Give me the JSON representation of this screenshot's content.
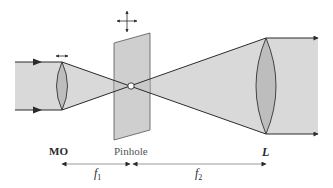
{
  "figure": {
    "colors": {
      "beam_fill": "#d9d9d9",
      "lens_fill": "#bdbdbd",
      "pinhole_plate_fill": "#d0d0d0",
      "line": "#2b2b2b",
      "dimension_line": "#888888"
    }
  },
  "labels": {
    "objective": "MO",
    "pinhole": "Pinhole",
    "lens": "L",
    "f1_symbol": "f",
    "f1_sub": "1",
    "f2_symbol": "f",
    "f2_sub": "2"
  },
  "components": [
    {
      "name": "microscope-objective",
      "label": "MO",
      "motion": "horizontal-translation-arrow"
    },
    {
      "name": "pinhole-plate",
      "label": "Pinhole",
      "motion": "xy-translation-arrows"
    },
    {
      "name": "collimating-lens",
      "label": "L"
    }
  ],
  "dimensions": [
    {
      "name": "f1",
      "from": "MO",
      "to": "Pinhole"
    },
    {
      "name": "f2",
      "from": "Pinhole",
      "to": "L"
    }
  ]
}
